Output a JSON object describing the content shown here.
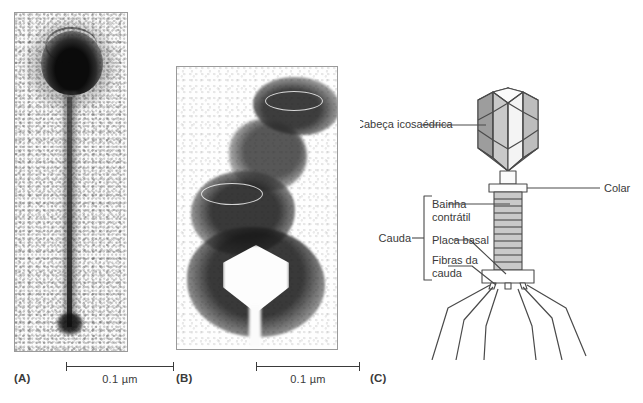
{
  "figure": {
    "panels": [
      {
        "id": "A",
        "label": "(A)",
        "type": "electron-micrograph",
        "description": "Bacteriophage with dark icosahedral head and long extended tail",
        "scalebar": {
          "value": "0.1",
          "unit": "µm",
          "text": "0.1 µm"
        }
      },
      {
        "id": "B",
        "label": "(B)",
        "type": "electron-micrograph",
        "description": "Bacteriophage particles, one with bright triangular head outline",
        "scalebar": {
          "value": "0.1",
          "unit": "µm",
          "text": "0.1 µm"
        }
      },
      {
        "id": "C",
        "label": "(C)",
        "type": "schematic-diagram",
        "description": "Labelled schematic of bacteriophage T4 structure"
      }
    ]
  },
  "diagram": {
    "labels": {
      "head": "Cabeça icosaédrica",
      "collar": "Colar",
      "tail_bracket": "Cauda",
      "sheath_line1": "Bainha",
      "sheath_line2": "contrátil",
      "baseplate": "Placa basal",
      "fibers_line1": "Fibras da",
      "fibers_line2": "cauda"
    },
    "colors": {
      "outline": "#4a4a4a",
      "head_facet_light": "#f2f2f2",
      "head_facet_mid": "#d8d8d8",
      "head_facet_dark": "#9d9d9d",
      "sheath": "#c9c9c9",
      "text": "#3a3a3a"
    },
    "tail_fiber_count": 6
  }
}
